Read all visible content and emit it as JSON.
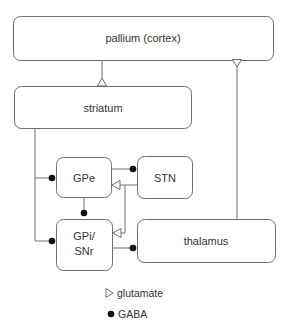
{
  "diagram": {
    "nodes": {
      "pallium": {
        "label": "pallium (cortex)"
      },
      "striatum": {
        "label": "striatum"
      },
      "gpe": {
        "label": "GPe"
      },
      "stn": {
        "label": "STN"
      },
      "gpi": {
        "label_line1": "GPi/",
        "label_line2": "SNr"
      },
      "thalamus": {
        "label": "thalamus"
      }
    },
    "edges": [
      {
        "from": "pallium",
        "to": "striatum",
        "type": "glutamate"
      },
      {
        "from": "thalamus",
        "to": "pallium",
        "type": "glutamate"
      },
      {
        "from": "striatum",
        "to": "GPe",
        "type": "GABA"
      },
      {
        "from": "striatum",
        "to": "GPi/SNr",
        "type": "GABA"
      },
      {
        "from": "GPe",
        "to": "GPi/SNr",
        "type": "GABA"
      },
      {
        "from": "GPe",
        "to": "STN",
        "type": "GABA"
      },
      {
        "from": "STN",
        "to": "GPe",
        "type": "glutamate"
      },
      {
        "from": "STN",
        "to": "GPi/SNr",
        "type": "glutamate"
      },
      {
        "from": "GPi/SNr",
        "to": "thalamus",
        "type": "GABA"
      }
    ],
    "legend": {
      "glutamate": "glutamate",
      "gaba": "GABA"
    },
    "colors": {
      "stroke": "#6e6e6e",
      "dot": "#111111",
      "text": "#333333"
    }
  }
}
